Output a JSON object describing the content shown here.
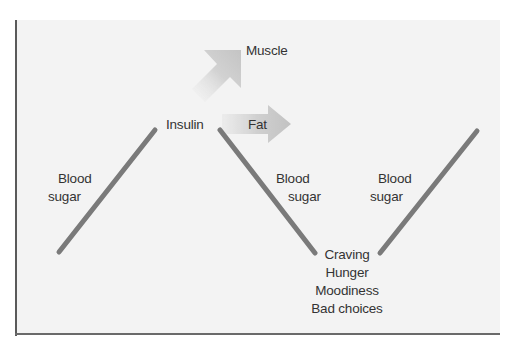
{
  "diagram": {
    "type": "blood-sugar-cycle",
    "colors": {
      "background": "#ffffff",
      "panel": "#f3f3f3",
      "frame": "#5a5a5a",
      "line": "#7a7a7a",
      "arrow_fill": "#c8c8c8",
      "text": "#333333"
    },
    "nodes": {
      "insulin": "Insulin",
      "muscle": "Muscle",
      "fat": "Fat",
      "rise_1": {
        "line1": "Blood",
        "line2": "sugar"
      },
      "fall": {
        "line1": "Blood",
        "line2": "sugar"
      },
      "rise_2": {
        "line1": "Blood",
        "line2": "sugar"
      },
      "low_effects": {
        "line1": "Craving",
        "line2": "Hunger",
        "line3": "Moodiness",
        "line4": "Bad choices"
      }
    },
    "edges": [
      {
        "from": "low-start",
        "to": "insulin",
        "label": "Blood sugar",
        "direction": "up"
      },
      {
        "from": "insulin",
        "to": "muscle",
        "label": "",
        "style": "arrow-diagonal"
      },
      {
        "from": "insulin",
        "to": "fat",
        "label": "",
        "style": "arrow-right"
      },
      {
        "from": "insulin",
        "to": "low_effects",
        "label": "Blood sugar",
        "direction": "down"
      },
      {
        "from": "low_effects",
        "to": "high-end",
        "label": "Blood sugar",
        "direction": "up"
      }
    ]
  }
}
